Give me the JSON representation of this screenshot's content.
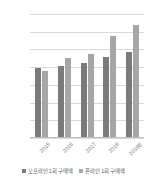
{
  "chart_data": {
    "type": "bar",
    "title": "",
    "xlabel": "",
    "ylabel": "",
    "categories": [
      "2015",
      "2016",
      "2017",
      "2018",
      "2019E"
    ],
    "series": [
      {
        "name": "오프라인 1회 구매액",
        "color": "#7b7b7b",
        "values": [
          1970,
          2030,
          2120,
          2290,
          2420
        ]
      },
      {
        "name": "온라인 1회 구매액",
        "color": "#a6a6a6",
        "values": [
          1900,
          2260,
          2380,
          2870,
          3180
        ]
      }
    ],
    "ylim": [
      0,
      3500
    ],
    "yticks": [
      0,
      500,
      1000,
      1500,
      2000,
      2500,
      3000,
      3500
    ],
    "ytick_labels": [
      "0",
      "500",
      "1,000",
      "1,500",
      "2,000",
      "2,500",
      "3,000",
      "3,500"
    ],
    "grid": true,
    "legend_position": "bottom",
    "gridline_color": "#d9d9d9",
    "axis_text_color": "#808080"
  }
}
